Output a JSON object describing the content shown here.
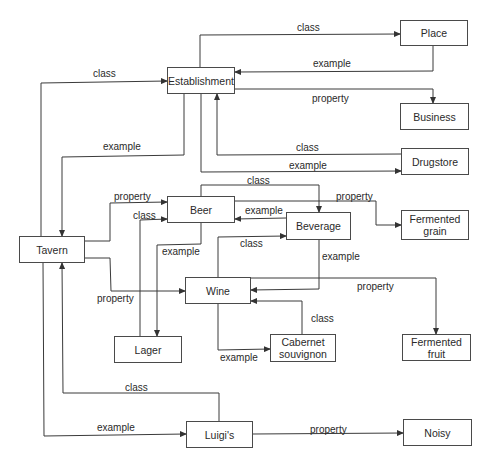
{
  "diagram": {
    "type": "semantic-network",
    "nodes": [
      {
        "id": "place",
        "label": "Place",
        "x": 400,
        "y": 20,
        "w": 68,
        "h": 26
      },
      {
        "id": "establishment",
        "label": "Establishment",
        "x": 167,
        "y": 67,
        "w": 68,
        "h": 27
      },
      {
        "id": "business",
        "label": "Business",
        "x": 400,
        "y": 103,
        "w": 69,
        "h": 27
      },
      {
        "id": "drugstore",
        "label": "Drugstore",
        "x": 401,
        "y": 148,
        "w": 68,
        "h": 27
      },
      {
        "id": "tavern",
        "label": "Tavern",
        "x": 19,
        "y": 236,
        "w": 66,
        "h": 27
      },
      {
        "id": "beer",
        "label": "Beer",
        "x": 167,
        "y": 196,
        "w": 68,
        "h": 27
      },
      {
        "id": "beverage",
        "label": "Beverage",
        "x": 286,
        "y": 212,
        "w": 65,
        "h": 28
      },
      {
        "id": "fermented_grain",
        "label": "Fermented\ngrain",
        "x": 401,
        "y": 210,
        "w": 68,
        "h": 30
      },
      {
        "id": "wine",
        "label": "Wine",
        "x": 185,
        "y": 277,
        "w": 66,
        "h": 27
      },
      {
        "id": "lager",
        "label": "Lager",
        "x": 114,
        "y": 336,
        "w": 68,
        "h": 27
      },
      {
        "id": "cabernet",
        "label": "Cabernet\nsouvignon",
        "x": 270,
        "y": 334,
        "w": 66,
        "h": 28
      },
      {
        "id": "fermented_fruit",
        "label": "Fermented\nfruit",
        "x": 402,
        "y": 334,
        "w": 69,
        "h": 27
      },
      {
        "id": "luigis",
        "label": "Luigi's",
        "x": 186,
        "y": 421,
        "w": 67,
        "h": 27
      },
      {
        "id": "noisy",
        "label": "Noisy",
        "x": 403,
        "y": 419,
        "w": 69,
        "h": 27
      }
    ],
    "edges": [
      {
        "from": "establishment",
        "to": "place",
        "label": "class",
        "label_x": 297,
        "label_y": 22,
        "points": [
          [
            200,
            67
          ],
          [
            200,
            35
          ],
          [
            400,
            34
          ]
        ]
      },
      {
        "from": "place",
        "to": "establishment",
        "label": "example",
        "label_x": 313,
        "label_y": 58,
        "points": [
          [
            433,
            46
          ],
          [
            433,
            71
          ],
          [
            235,
            72
          ]
        ]
      },
      {
        "from": "establishment",
        "to": "business",
        "label": "property",
        "label_x": 312,
        "label_y": 93,
        "points": [
          [
            235,
            89
          ],
          [
            433,
            89
          ],
          [
            433,
            103
          ]
        ]
      },
      {
        "from": "tavern",
        "to": "establishment",
        "label": "class",
        "label_x": 93,
        "label_y": 68,
        "points": [
          [
            41,
            236
          ],
          [
            41,
            83
          ],
          [
            167,
            81
          ]
        ]
      },
      {
        "from": "establishment",
        "to": "tavern",
        "label": "example",
        "label_x": 103,
        "label_y": 141,
        "points": [
          [
            184,
            94
          ],
          [
            184,
            155
          ],
          [
            62,
            157
          ],
          [
            62,
            236
          ]
        ]
      },
      {
        "from": "drugstore",
        "to": "establishment",
        "label": "class",
        "label_x": 296,
        "label_y": 142,
        "points": [
          [
            401,
            154
          ],
          [
            217,
            155
          ],
          [
            217,
            94
          ]
        ]
      },
      {
        "from": "establishment",
        "to": "drugstore",
        "label": "example",
        "label_x": 289,
        "label_y": 160,
        "points": [
          [
            201,
            94
          ],
          [
            201,
            172
          ],
          [
            401,
            171
          ]
        ]
      },
      {
        "from": "tavern",
        "to": "beer",
        "label": "property",
        "label_x": 114,
        "label_y": 191,
        "points": [
          [
            85,
            241
          ],
          [
            110,
            241
          ],
          [
            110,
            203
          ],
          [
            167,
            202
          ]
        ]
      },
      {
        "from": "lager",
        "to": "beer",
        "label": "class",
        "label_x": 133,
        "label_y": 210,
        "points": [
          [
            140,
            336
          ],
          [
            140,
            220
          ],
          [
            167,
            219
          ]
        ]
      },
      {
        "from": "beer",
        "to": "beverage",
        "label": "class",
        "label_x": 247,
        "label_y": 175,
        "points": [
          [
            201,
            196
          ],
          [
            201,
            185
          ],
          [
            319,
            185
          ],
          [
            319,
            212
          ]
        ]
      },
      {
        "from": "beverage",
        "to": "beer",
        "label": "example",
        "label_x": 245,
        "label_y": 205,
        "points": [
          [
            286,
            218
          ],
          [
            235,
            219
          ]
        ]
      },
      {
        "from": "beer",
        "to": "fermented_grain",
        "label": "property",
        "label_x": 336,
        "label_y": 191,
        "points": [
          [
            235,
            201
          ],
          [
            376,
            201
          ],
          [
            376,
            225
          ],
          [
            401,
            225
          ]
        ]
      },
      {
        "from": "beer",
        "to": "lager",
        "label": "example",
        "label_x": 162,
        "label_y": 246,
        "points": [
          [
            201,
            223
          ],
          [
            201,
            244
          ],
          [
            157,
            245
          ],
          [
            157,
            336
          ]
        ]
      },
      {
        "from": "wine",
        "to": "beverage",
        "label": "class",
        "label_x": 240,
        "label_y": 238,
        "points": [
          [
            218,
            277
          ],
          [
            218,
            237
          ],
          [
            286,
            236
          ]
        ]
      },
      {
        "from": "beverage",
        "to": "wine",
        "label": "example",
        "label_x": 322,
        "label_y": 251,
        "points": [
          [
            319,
            240
          ],
          [
            319,
            289
          ],
          [
            251,
            290
          ]
        ]
      },
      {
        "from": "wine",
        "to": "fermented_fruit",
        "label": "property",
        "label_x": 357,
        "label_y": 281,
        "points": [
          [
            251,
            278
          ],
          [
            436,
            278
          ],
          [
            436,
            334
          ]
        ]
      },
      {
        "from": "tavern",
        "to": "wine",
        "label": "property",
        "label_x": 97,
        "label_y": 293,
        "points": [
          [
            85,
            258
          ],
          [
            110,
            258
          ],
          [
            111,
            291
          ],
          [
            185,
            291
          ]
        ]
      },
      {
        "from": "cabernet",
        "to": "wine",
        "label": "class",
        "label_x": 311,
        "label_y": 313,
        "points": [
          [
            302,
            334
          ],
          [
            302,
            301
          ],
          [
            251,
            301
          ]
        ]
      },
      {
        "from": "wine",
        "to": "cabernet",
        "label": "example",
        "label_x": 220,
        "label_y": 352,
        "points": [
          [
            218,
            304
          ],
          [
            218,
            350
          ],
          [
            270,
            349
          ]
        ]
      },
      {
        "from": "luigis",
        "to": "tavern",
        "label": "class",
        "label_x": 125,
        "label_y": 382,
        "points": [
          [
            219,
            421
          ],
          [
            219,
            393
          ],
          [
            63,
            393
          ],
          [
            62,
            263
          ]
        ]
      },
      {
        "from": "tavern",
        "to": "luigis",
        "label": "example",
        "label_x": 97,
        "label_y": 422,
        "points": [
          [
            43,
            263
          ],
          [
            44,
            436
          ],
          [
            186,
            434
          ]
        ]
      },
      {
        "from": "luigis",
        "to": "noisy",
        "label": "property",
        "label_x": 310,
        "label_y": 424,
        "points": [
          [
            253,
            434
          ],
          [
            403,
            433
          ]
        ]
      }
    ]
  }
}
